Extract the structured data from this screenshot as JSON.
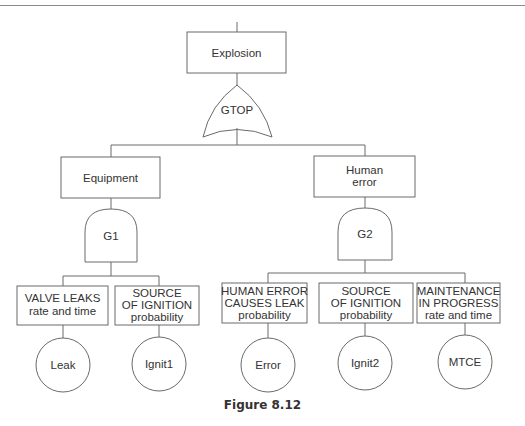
{
  "figure": {
    "caption": "Figure 8.12",
    "top_event": {
      "label": "Explosion"
    },
    "top_gate": {
      "label": "GTOP",
      "type": "OR"
    },
    "branches": [
      {
        "event": {
          "label_lines": [
            "Equipment"
          ]
        },
        "gate": {
          "label": "G1",
          "type": "AND"
        },
        "inputs": [
          {
            "description_lines": [
              "VALVE LEAKS",
              "rate and time"
            ],
            "basic_event": "Leak"
          },
          {
            "description_lines": [
              "SOURCE",
              "OF IGNITION",
              "probability"
            ],
            "basic_event": "Ignit1"
          }
        ]
      },
      {
        "event": {
          "label_lines": [
            "Human",
            "error"
          ]
        },
        "gate": {
          "label": "G2",
          "type": "AND"
        },
        "inputs": [
          {
            "description_lines": [
              "HUMAN ERROR",
              "CAUSES LEAK",
              "probability"
            ],
            "basic_event": "Error"
          },
          {
            "description_lines": [
              "SOURCE",
              "OF IGNITION",
              "probability"
            ],
            "basic_event": "Ignit2"
          },
          {
            "description_lines": [
              "MAINTENANCE",
              "IN PROGRESS",
              "rate and time"
            ],
            "basic_event": "MTCE"
          }
        ]
      }
    ]
  },
  "colors": {
    "line": "#6a6a6a",
    "text": "#333333"
  }
}
